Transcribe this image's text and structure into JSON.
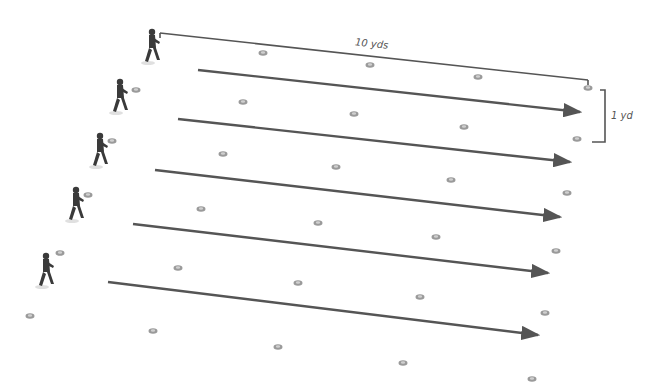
{
  "diagram": {
    "type": "drill-layout",
    "labels": {
      "length": "10 yds",
      "spacing": "1 yd"
    },
    "colors": {
      "arrow": "#555555",
      "cone": "#9a9a9a",
      "cone_inner": "#cfcfcf",
      "player": "#3a3a3a"
    },
    "lanes": [
      {
        "player": [
          152,
          46
        ],
        "arrow": [
          [
            198,
            70
          ],
          [
            580,
            112
          ]
        ]
      },
      {
        "player": [
          120,
          96
        ],
        "arrow": [
          [
            178,
            119
          ],
          [
            570,
            162
          ]
        ]
      },
      {
        "player": [
          100,
          150
        ],
        "arrow": [
          [
            155,
            170
          ],
          [
            560,
            217
          ]
        ]
      },
      {
        "player": [
          76,
          204
        ],
        "arrow": [
          [
            133,
            224
          ],
          [
            548,
            273
          ]
        ]
      },
      {
        "player": [
          46,
          270
        ],
        "arrow": [
          [
            108,
            282
          ],
          [
            538,
            335
          ]
        ]
      }
    ],
    "measure_line": [
      [
        160,
        33
      ],
      [
        588,
        80
      ]
    ],
    "bracket": [
      [
        600,
        90
      ],
      [
        605,
        90
      ],
      [
        605,
        142
      ],
      [
        592,
        142
      ]
    ],
    "cones": [
      [
        263,
        53
      ],
      [
        370,
        65
      ],
      [
        478,
        77
      ],
      [
        588,
        88
      ],
      [
        136,
        90
      ],
      [
        243,
        102
      ],
      [
        354,
        114
      ],
      [
        464,
        127
      ],
      [
        577,
        139
      ],
      [
        112,
        141
      ],
      [
        223,
        154
      ],
      [
        336,
        167
      ],
      [
        451,
        180
      ],
      [
        567,
        193
      ],
      [
        88,
        195
      ],
      [
        201,
        209
      ],
      [
        318,
        223
      ],
      [
        436,
        237
      ],
      [
        556,
        251
      ],
      [
        60,
        253
      ],
      [
        178,
        268
      ],
      [
        298,
        283
      ],
      [
        420,
        297
      ],
      [
        545,
        313
      ],
      [
        30,
        316
      ],
      [
        153,
        331
      ],
      [
        278,
        347
      ],
      [
        403,
        363
      ],
      [
        532,
        379
      ]
    ]
  }
}
